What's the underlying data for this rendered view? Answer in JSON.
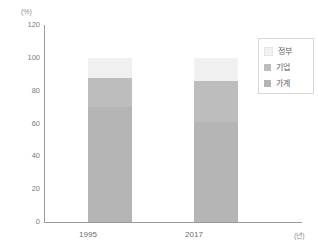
{
  "chart_data": {
    "type": "bar",
    "subtype": "stacked-bar",
    "title": "",
    "xlabel": "(년)",
    "ylabel": "(%)",
    "categories": [
      "1995",
      "2017"
    ],
    "series": [
      {
        "name": "가계",
        "values": [
          70,
          61
        ],
        "color": "#b5b5b5"
      },
      {
        "name": "기업",
        "values": [
          18,
          25
        ],
        "color": "#bdbdbd"
      },
      {
        "name": "정부",
        "values": [
          12,
          14
        ],
        "color": "#f0f0f0"
      }
    ],
    "stack_totals": [
      100,
      100
    ],
    "ylim": [
      0,
      120
    ],
    "ytick_values": [
      120,
      100,
      80,
      60,
      40,
      20,
      0
    ],
    "ytick_labels": [
      "120",
      "100",
      "80",
      "60",
      "40",
      "20",
      "0"
    ],
    "grid": false,
    "legend_position": "top-right",
    "legend_entries": [
      "정부",
      "기업",
      "가계"
    ]
  },
  "axes": {
    "y_unit": "(%)",
    "x_unit": "(년)",
    "y_ticks": [
      "120",
      "100",
      "80",
      "60",
      "40",
      "20",
      "0"
    ],
    "x_ticks": [
      "1995",
      "2017"
    ]
  },
  "legend": {
    "items": [
      {
        "label": "정부",
        "color": "#f2f2f2"
      },
      {
        "label": "기업",
        "color": "#bdbdbd"
      },
      {
        "label": "가계",
        "color": "#b5b5b5"
      }
    ]
  },
  "colors": {
    "axis": "#9a9a9a",
    "tick_text": "#7b7b7b",
    "background": "#ffffff",
    "government": "#f2f2f2",
    "business": "#bdbdbd",
    "household": "#b5b5b5"
  }
}
